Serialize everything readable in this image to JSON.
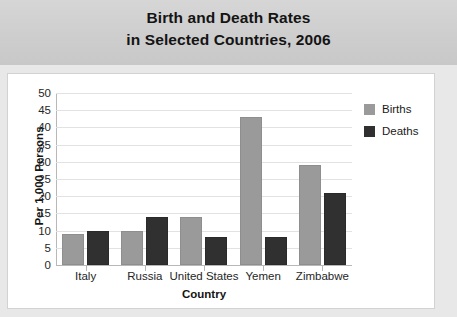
{
  "header": {
    "title_lines": [
      "Birth and Death Rates",
      "in Selected Countries, 2006"
    ],
    "band_color": "#cdcdcd"
  },
  "panel": {
    "background": "#ffffff",
    "border_color": "#d2d2d2"
  },
  "legend": {
    "position": "top-right",
    "entries": [
      {
        "label": "Births",
        "color": "#9a9a9a"
      },
      {
        "label": "Deaths",
        "color": "#303030"
      }
    ]
  },
  "axes": {
    "ylabel": "Per 1,000 Persons",
    "xlabel": "Country",
    "ytick_labels": [
      "50",
      "45",
      "40",
      "35",
      "30",
      "25",
      "20",
      "15",
      "10",
      "5",
      "0"
    ],
    "xtick_labels": [
      "Italy",
      "Russia",
      "United States",
      "Yemen",
      "Zimbabwe"
    ]
  },
  "chart_data": {
    "type": "bar",
    "title": "Birth and Death Rates in Selected Countries, 2006",
    "xlabel": "Country",
    "ylabel": "Per 1,000 Persons",
    "ylim": [
      0,
      50
    ],
    "ytick_step": 5,
    "yticks": [
      0,
      5,
      10,
      15,
      20,
      25,
      30,
      35,
      40,
      45,
      50
    ],
    "grid": true,
    "grid_axis": "y",
    "legend_position": "top-right",
    "categories": [
      "Italy",
      "Russia",
      "United States",
      "Yemen",
      "Zimbabwe"
    ],
    "series": [
      {
        "name": "Births",
        "color": "#9a9a9a",
        "values": [
          9,
          10,
          14,
          43,
          29
        ]
      },
      {
        "name": "Deaths",
        "color": "#303030",
        "values": [
          10,
          14,
          8,
          8,
          21
        ]
      }
    ]
  }
}
